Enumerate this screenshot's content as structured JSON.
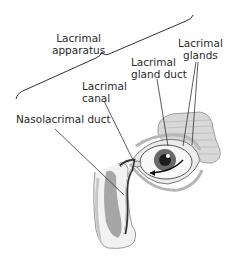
{
  "diagram": {
    "labels": {
      "lacrimal_apparatus": [
        "Lacrimal",
        "apparatus"
      ],
      "lacrimal_glands": [
        "Lacrimal",
        "glands"
      ],
      "lacrimal_gland_duct": [
        "Lacrimal",
        "gland duct"
      ],
      "lacrimal_canal": [
        "Lacrimal",
        "canal"
      ],
      "nasolacrimal_duct": "Nasolacrimal duct"
    },
    "colors": {
      "text": "#2a2a2a",
      "lines": "#333333",
      "illustration_shade": "#9a9a9a",
      "background": "#ffffff"
    }
  }
}
